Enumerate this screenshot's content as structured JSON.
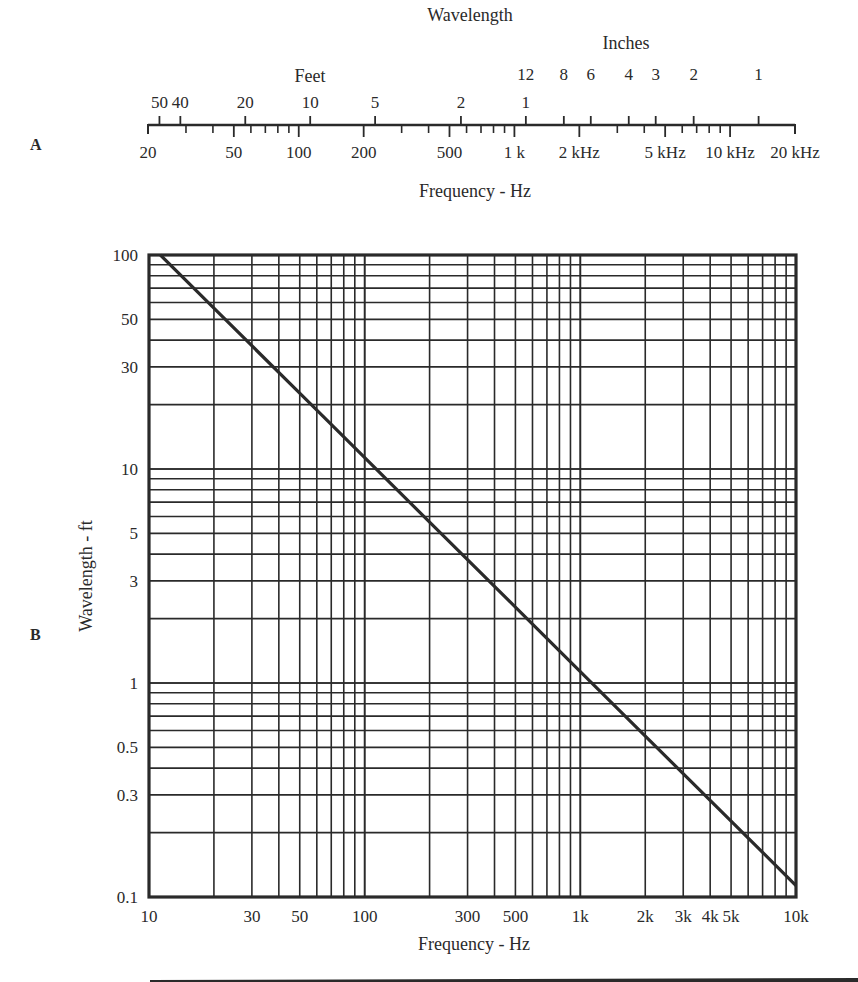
{
  "chart_data": [
    {
      "id": "A",
      "type": "table",
      "panel_label": "A",
      "title": "Wavelength",
      "description": "Nomograph: frequency scale (bottom) vs wavelength scale (top) for sound in air",
      "upper_scale": {
        "feet_label": "Feet",
        "inches_label": "Inches",
        "feet_ticks": [
          "50",
          "40",
          "20",
          "10",
          "5",
          "2",
          "1"
        ],
        "inches_ticks": [
          "12",
          "8",
          "6",
          "4",
          "3",
          "2",
          "1"
        ]
      },
      "lower_scale": {
        "label": "Frequency - Hz",
        "major_ticks": [
          "20",
          "50",
          "100",
          "200",
          "500",
          "1 k",
          "2 kHz",
          "5 kHz",
          "10 kHz",
          "20 kHz"
        ],
        "range_hz": [
          20,
          20000
        ]
      }
    },
    {
      "id": "B",
      "type": "line",
      "panel_label": "B",
      "title": "",
      "xlabel": "Frequency - Hz",
      "ylabel": "Wavelength - ft",
      "xscale": "log",
      "yscale": "log",
      "xlim": [
        10,
        10000
      ],
      "ylim": [
        0.1,
        100
      ],
      "grid": true,
      "x_tick_labels": [
        "10",
        "30",
        "50",
        "100",
        "300",
        "500",
        "1k",
        "2k",
        "3k",
        "4k",
        "5k",
        "10k"
      ],
      "y_tick_labels": [
        "100",
        "50",
        "30",
        "10",
        "5",
        "3",
        "1",
        "0.5",
        "0.3",
        "0.1"
      ],
      "series": [
        {
          "name": "Wavelength (1130 / f)",
          "x": [
            11.3,
            20,
            50,
            100,
            200,
            500,
            1000,
            2000,
            5000,
            10000
          ],
          "y": [
            100,
            56.5,
            22.6,
            11.3,
            5.65,
            2.26,
            1.13,
            0.565,
            0.226,
            0.113
          ]
        }
      ]
    }
  ],
  "panelA": {
    "label": "A",
    "title": "Wavelength",
    "feet_label": "Feet",
    "inches_label": "Inches",
    "freq_label": "Frequency - Hz",
    "feet": [
      {
        "t": "50",
        "ft": 50
      },
      {
        "t": "40",
        "ft": 40
      },
      {
        "t": "20",
        "ft": 20
      },
      {
        "t": "10",
        "ft": 10
      },
      {
        "t": "5",
        "ft": 5
      },
      {
        "t": "2",
        "ft": 2
      },
      {
        "t": "1",
        "ft": 1
      }
    ],
    "inches": [
      {
        "t": "12",
        "in": 12
      },
      {
        "t": "8",
        "in": 8
      },
      {
        "t": "6",
        "in": 6
      },
      {
        "t": "4",
        "in": 4
      },
      {
        "t": "3",
        "in": 3
      },
      {
        "t": "2",
        "in": 2
      },
      {
        "t": "1",
        "in": 1
      }
    ],
    "freq_major": [
      {
        "t": "20",
        "f": 20
      },
      {
        "t": "50",
        "f": 50
      },
      {
        "t": "100",
        "f": 100
      },
      {
        "t": "200",
        "f": 200
      },
      {
        "t": "500",
        "f": 500
      },
      {
        "t": "1 k",
        "f": 1000
      },
      {
        "t": "2 kHz",
        "f": 2000
      },
      {
        "t": "5 kHz",
        "f": 5000
      },
      {
        "t": "10 kHz",
        "f": 10000
      },
      {
        "t": "20 kHz",
        "f": 20000
      }
    ]
  },
  "panelB": {
    "label": "B",
    "xlabel": "Frequency - Hz",
    "ylabel": "Wavelength - ft",
    "xticks": [
      {
        "t": "10",
        "v": 10
      },
      {
        "t": "30",
        "v": 30
      },
      {
        "t": "50",
        "v": 50
      },
      {
        "t": "100",
        "v": 100
      },
      {
        "t": "300",
        "v": 300
      },
      {
        "t": "500",
        "v": 500
      },
      {
        "t": "1k",
        "v": 1000
      },
      {
        "t": "2k",
        "v": 2000
      },
      {
        "t": "3k",
        "v": 3000
      },
      {
        "t": "4k",
        "v": 4000
      },
      {
        "t": "5k",
        "v": 5000
      },
      {
        "t": "10k",
        "v": 10000
      }
    ],
    "yticks": [
      {
        "t": "100",
        "v": 100
      },
      {
        "t": "50",
        "v": 50
      },
      {
        "t": "30",
        "v": 30
      },
      {
        "t": "10",
        "v": 10
      },
      {
        "t": "5",
        "v": 5
      },
      {
        "t": "3",
        "v": 3
      },
      {
        "t": "1",
        "v": 1
      },
      {
        "t": "0.5",
        "v": 0.5
      },
      {
        "t": "0.3",
        "v": 0.3
      },
      {
        "t": "0.1",
        "v": 0.1
      }
    ]
  },
  "colors": {
    "ink": "#2a2a2a",
    "background": "#ffffff"
  }
}
